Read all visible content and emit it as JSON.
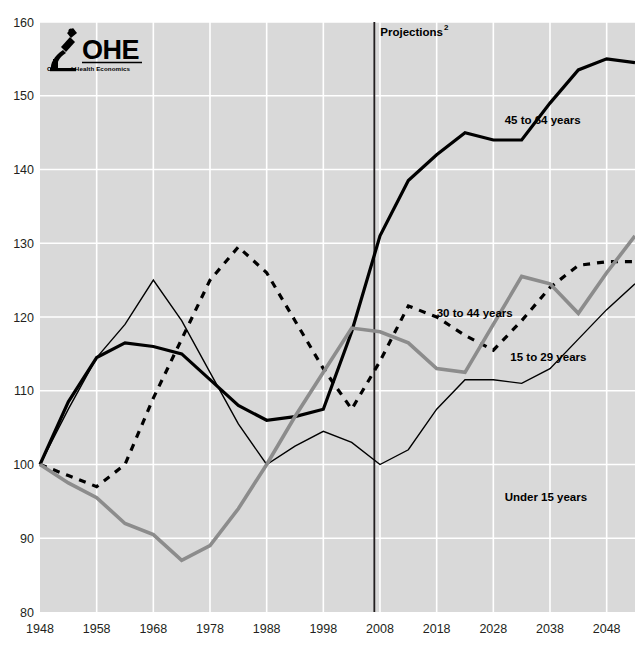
{
  "logo": {
    "name": "OHE",
    "subtitle": "Office of Health Economics",
    "icon": "microscope-icon"
  },
  "annotations": {
    "projections": {
      "label": "Projections",
      "superscript": "2",
      "at_year": 2007
    }
  },
  "chart_data": {
    "type": "line",
    "title": "",
    "subtitle": "",
    "xlabel": "",
    "ylabel": "",
    "xlim": [
      1948,
      2053
    ],
    "ylim": [
      80,
      160
    ],
    "xticks": [
      1948,
      1958,
      1968,
      1978,
      1988,
      1998,
      2008,
      2018,
      2028,
      2038,
      2048
    ],
    "yticks": [
      80,
      90,
      100,
      110,
      120,
      130,
      140,
      150,
      160
    ],
    "xtick_labels": [
      "1948",
      "1958",
      "1968",
      "1978",
      "1988",
      "1998",
      "2008",
      "2018",
      "2028",
      "2038",
      "2048"
    ],
    "ytick_labels": [
      "80",
      "90",
      "100",
      "110",
      "120",
      "130",
      "140",
      "150",
      "160"
    ],
    "grid": true,
    "grid_color": "#ffffff",
    "plot_bg": "#d9d9d9",
    "legend_position": "inline-right",
    "vline": {
      "x": 2007,
      "color": "#231f20",
      "label": "Projections"
    },
    "series": [
      {
        "name": "45 to 64 years",
        "style": "solid",
        "color": "#000000",
        "width": 3.2,
        "label_x": 2030,
        "label_y": 146.2,
        "x": [
          1948,
          1953,
          1958,
          1963,
          1968,
          1973,
          1978,
          1983,
          1988,
          1993,
          1998,
          2003,
          2008,
          2013,
          2018,
          2023,
          2028,
          2033,
          2038,
          2043,
          2048,
          2053
        ],
        "y": [
          100.0,
          108.5,
          114.5,
          116.5,
          116.0,
          115.0,
          111.5,
          108.0,
          106.0,
          106.5,
          107.5,
          118.0,
          131.0,
          138.5,
          142.0,
          145.0,
          144.0,
          144.0,
          149.0,
          153.5,
          155.0,
          154.5
        ]
      },
      {
        "name": "30 to 44 years",
        "style": "dashed",
        "color": "#000000",
        "width": 3.2,
        "label_x": 2018,
        "label_y": 120.0,
        "x": [
          1948,
          1953,
          1958,
          1963,
          1968,
          1973,
          1978,
          1983,
          1988,
          1993,
          1998,
          2003,
          2008,
          2013,
          2018,
          2023,
          2028,
          2033,
          2038,
          2043,
          2048,
          2053
        ],
        "y": [
          100.0,
          98.5,
          97.0,
          100.0,
          109.0,
          117.0,
          125.0,
          129.5,
          126.0,
          119.5,
          113.0,
          107.5,
          114.0,
          121.5,
          120.0,
          117.5,
          115.5,
          119.5,
          124.0,
          127.0,
          127.5,
          127.5
        ]
      },
      {
        "name": "15 to 29 years",
        "style": "solid",
        "color": "#000000",
        "width": 1.4,
        "label_x": 2031,
        "label_y": 114.0,
        "x": [
          1948,
          1953,
          1958,
          1963,
          1968,
          1973,
          1978,
          1983,
          1988,
          1993,
          1998,
          2003,
          2008,
          2013,
          2018,
          2023,
          2028,
          2033,
          2038,
          2043,
          2048,
          2053
        ],
        "y": [
          100.0,
          107.5,
          114.5,
          119.0,
          125.0,
          119.5,
          112.5,
          105.5,
          100.0,
          102.5,
          104.5,
          103.0,
          100.0,
          102.0,
          107.5,
          111.5,
          111.5,
          111.0,
          113.0,
          117.0,
          121.0,
          124.5
        ]
      },
      {
        "name": "Under 15 years",
        "style": "solid",
        "color": "#8c8c8c",
        "width": 3.6,
        "label_x": 2030,
        "label_y": 95.0,
        "x": [
          1948,
          1953,
          1958,
          1963,
          1968,
          1973,
          1978,
          1983,
          1988,
          1993,
          1998,
          2003,
          2008,
          2013,
          2018,
          2023,
          2028,
          2033,
          2038,
          2043,
          2048,
          2053
        ],
        "y": [
          100.0,
          97.5,
          95.5,
          92.0,
          90.5,
          87.0,
          89.0,
          94.0,
          100.0,
          106.5,
          112.5,
          118.5,
          118.0,
          116.5,
          113.0,
          112.5,
          119.0,
          125.5,
          124.5,
          120.5,
          126.0,
          131.0
        ]
      }
    ]
  }
}
